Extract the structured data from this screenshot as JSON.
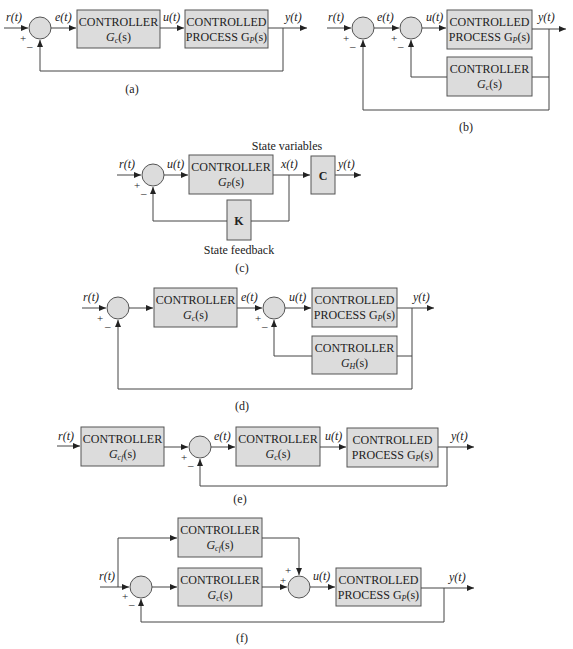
{
  "figure": {
    "panels": [
      {
        "id": "a",
        "caption": "(a)",
        "signals": {
          "input": "r(t)",
          "error": "e(t)",
          "control": "u(t)",
          "output": "y(t)"
        },
        "signs": {
          "plus": "+",
          "minus": "–"
        },
        "blocks": [
          {
            "line1": "CONTROLLER",
            "line2": "G",
            "sub": "c",
            "tail": "(s)"
          },
          {
            "line1": "CONTROLLED",
            "line2": "PROCESS G",
            "sub": "P",
            "tail": "(s)"
          }
        ]
      },
      {
        "id": "b",
        "caption": "(b)",
        "signals": {
          "input": "r(t)",
          "error": "e(t)",
          "control": "u(t)",
          "output": "y(t)"
        },
        "signs": {
          "plus": "+",
          "minus": "–"
        },
        "blocks": [
          {
            "line1": "CONTROLLED",
            "line2": "PROCESS G",
            "sub": "P",
            "tail": "(s)"
          },
          {
            "line1": "CONTROLLER",
            "line2": "G",
            "sub": "c",
            "tail": "(s)"
          }
        ]
      },
      {
        "id": "c",
        "caption": "(c)",
        "signals": {
          "input": "r(t)",
          "control": "u(t)",
          "state": "x(t)",
          "output": "y(t)"
        },
        "signs": {
          "plus": "+",
          "minus": "–"
        },
        "annotations": {
          "top": "State variables",
          "bottom": "State feedback"
        },
        "blocks": [
          {
            "line1": "CONTROLLER",
            "line2": "G",
            "sub": "P",
            "tail": "(s)"
          },
          {
            "label": "C"
          },
          {
            "label": "K"
          }
        ]
      },
      {
        "id": "d",
        "caption": "(d)",
        "signals": {
          "input": "r(t)",
          "error": "e(t)",
          "control": "u(t)",
          "output": "y(t)"
        },
        "signs": {
          "plus": "+",
          "minus": "–"
        },
        "blocks": [
          {
            "line1": "CONTROLLER",
            "line2": "G",
            "sub": "c",
            "tail": "(s)"
          },
          {
            "line1": "CONTROLLED",
            "line2": "PROCESS G",
            "sub": "P",
            "tail": "(s)"
          },
          {
            "line1": "CONTROLLER",
            "line2": "G",
            "sub": "H",
            "tail": "(s)"
          }
        ]
      },
      {
        "id": "e",
        "caption": "(e)",
        "signals": {
          "input": "r(t)",
          "error": "e(t)",
          "control": "u(t)",
          "output": "y(t)"
        },
        "signs": {
          "plus": "+",
          "minus": "–"
        },
        "blocks": [
          {
            "line1": "CONTROLLER",
            "line2": "G",
            "sub": "cf",
            "tail": "(s)"
          },
          {
            "line1": "CONTROLLER",
            "line2": "G",
            "sub": "c",
            "tail": "(s)"
          },
          {
            "line1": "CONTROLLED",
            "line2": "PROCESS G",
            "sub": "P",
            "tail": "(s)"
          }
        ]
      },
      {
        "id": "f",
        "caption": "(f)",
        "signals": {
          "input": "r(t)",
          "control": "u(t)",
          "output": "y(t)"
        },
        "signs": {
          "plus": "+",
          "minus": "–"
        },
        "blocks": [
          {
            "line1": "CONTROLLER",
            "line2": "G",
            "sub": "cf",
            "tail": "(s)"
          },
          {
            "line1": "CONTROLLER",
            "line2": "G",
            "sub": "c",
            "tail": "(s)"
          },
          {
            "line1": "CONTROLLED",
            "line2": "PROCESS G",
            "sub": "P",
            "tail": "(s)"
          }
        ]
      }
    ]
  }
}
